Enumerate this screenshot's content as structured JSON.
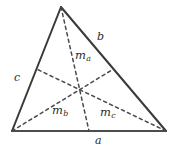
{
  "figure": {
    "type": "triangle-medians-diagram",
    "background_color": "#ffffff",
    "stroke_color": "#3a3a3a",
    "dash_color": "#4a4a4a",
    "text_color": "#2b2b2b"
  },
  "geometry": {
    "vertices": {
      "apex": {
        "x": 61,
        "y": 7
      },
      "bottom_left": {
        "x": 12,
        "y": 131
      },
      "bottom_right": {
        "x": 166,
        "y": 131
      }
    },
    "midpoints": {
      "side_a_bottom": {
        "x": 89,
        "y": 131
      },
      "side_b_right": {
        "x": 113.5,
        "y": 69
      },
      "side_c_left": {
        "x": 36.5,
        "y": 69
      }
    },
    "centroid": {
      "x": 79.7,
      "y": 89.7
    }
  },
  "labels": {
    "side_a": "a",
    "side_b": "b",
    "side_c": "c",
    "median_a": {
      "base": "m",
      "sub": "a"
    },
    "median_b": {
      "base": "m",
      "sub": "b"
    },
    "median_c": {
      "base": "m",
      "sub": "c"
    }
  }
}
